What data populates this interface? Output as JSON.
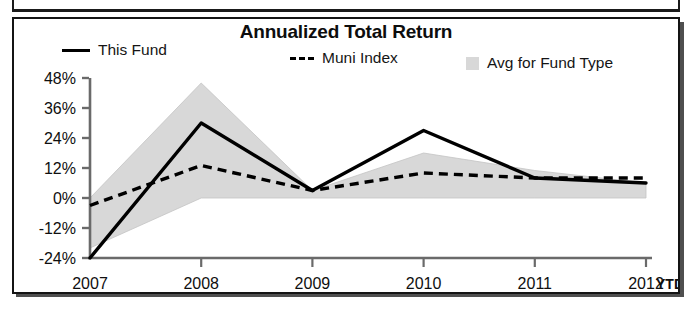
{
  "chart_data": {
    "type": "line",
    "title": "Annualized Total Return",
    "xlabel": "",
    "ylabel": "",
    "categories": [
      "2007",
      "2008",
      "2009",
      "2010",
      "2011",
      "2012"
    ],
    "x_extra_label": "YTD",
    "ylim": [
      -24,
      48
    ],
    "yticks": [
      48,
      36,
      24,
      12,
      0,
      -12,
      -24
    ],
    "ytick_labels": [
      "48%",
      "36%",
      "24%",
      "12%",
      "0%",
      "-12%",
      "-24%"
    ],
    "grid": false,
    "legend_position": "top",
    "series": [
      {
        "name": "This Fund",
        "style": "solid-line",
        "color": "#000000",
        "values": [
          -24,
          30,
          3,
          27,
          8,
          6
        ]
      },
      {
        "name": "Muni Index",
        "style": "dashed-line",
        "color": "#000000",
        "values": [
          -3,
          13,
          3,
          10,
          8,
          8
        ]
      },
      {
        "name": "Avg for Fund Type",
        "style": "shaded-band",
        "color": "#d8d8d8",
        "upper_values": [
          0,
          46,
          3,
          18,
          11,
          6
        ],
        "lower_values": [
          -20,
          0,
          0,
          0,
          0,
          0
        ]
      }
    ]
  },
  "legend": {
    "this_fund": "This Fund",
    "muni_index": "Muni Index",
    "avg_for_fund_type": "Avg for Fund Type"
  },
  "axis": {
    "y_labels": [
      "48%",
      "36%",
      "24%",
      "12%",
      "0%",
      "-12%",
      "-24%"
    ],
    "x_labels": [
      "2007",
      "2008",
      "2009",
      "2010",
      "2011",
      "2012"
    ],
    "x_suffix": "YTD"
  },
  "colors": {
    "series_line": "#000000",
    "band_fill": "#d8d8d8",
    "axis": "#6a6a6a",
    "frame": "#141414"
  }
}
